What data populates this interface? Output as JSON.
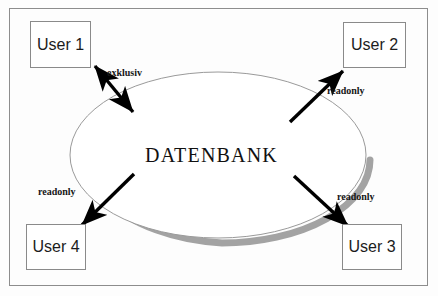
{
  "diagram": {
    "frame": {
      "border_color": "#8d8d8d",
      "background_color": "#fdfdfd"
    },
    "center": {
      "label": "DATENBANK",
      "shape": "ellipse",
      "outline_color": "#9a9a9a",
      "fill_color": "#ffffff",
      "shadow_color": "#9e9e9e"
    },
    "nodes": [
      {
        "id": "user-1",
        "label": "User 1",
        "position": "top-left"
      },
      {
        "id": "user-2",
        "label": "User 2",
        "position": "top-right"
      },
      {
        "id": "user-3",
        "label": "User 3",
        "position": "bottom-right"
      },
      {
        "id": "user-4",
        "label": "User 4",
        "position": "bottom-left"
      }
    ],
    "edges": [
      {
        "id": "edge-user-1",
        "from": "user-1",
        "to": "center",
        "label": "exklusiv",
        "arrow": "double",
        "color": "#000000"
      },
      {
        "id": "edge-user-2",
        "from": "center",
        "to": "user-2",
        "label": "readonly",
        "arrow": "single",
        "color": "#000000"
      },
      {
        "id": "edge-user-3",
        "from": "center",
        "to": "user-3",
        "label": "readonly",
        "arrow": "single",
        "color": "#000000"
      },
      {
        "id": "edge-user-4",
        "from": "center",
        "to": "user-4",
        "label": "readonly",
        "arrow": "single",
        "color": "#000000"
      }
    ]
  }
}
